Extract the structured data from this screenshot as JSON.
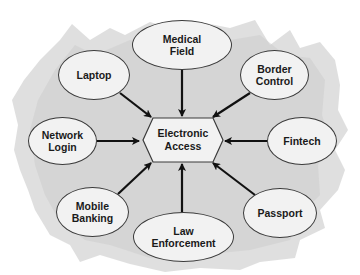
{
  "diagram": {
    "type": "hub-and-spoke",
    "center": {
      "line1": "Electronic",
      "line2": "Access"
    },
    "nodes": [
      {
        "id": "medical-field",
        "line1": "Medical",
        "line2": "Field"
      },
      {
        "id": "laptop",
        "line1": "Laptop",
        "line2": ""
      },
      {
        "id": "border-control",
        "line1": "Border",
        "line2": "Control"
      },
      {
        "id": "network-login",
        "line1": "Network",
        "line2": "Login"
      },
      {
        "id": "fintech",
        "line1": "Fintech",
        "line2": ""
      },
      {
        "id": "mobile-banking",
        "line1": "Mobile",
        "line2": "Banking"
      },
      {
        "id": "law-enforcement",
        "line1": "Law",
        "line2": "Enforcement"
      },
      {
        "id": "passport",
        "line1": "Passport",
        "line2": ""
      }
    ],
    "edges_direction": "node-to-center",
    "colors": {
      "background_blob": "#d9d9d9",
      "node_fill": "#f2f2f2",
      "node_stroke": "#3a3a3a",
      "arrow": "#111111",
      "text": "#1a1a1a"
    }
  }
}
